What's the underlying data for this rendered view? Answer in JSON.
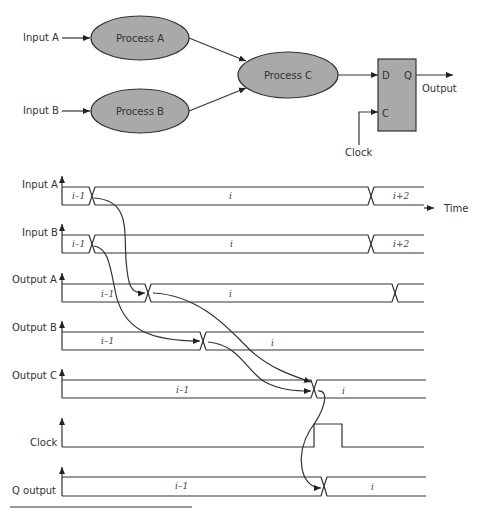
{
  "block_diagram": {
    "inputs": [
      {
        "label": "Input A"
      },
      {
        "label": "Input B"
      }
    ],
    "processes": [
      {
        "label": "Process A"
      },
      {
        "label": "Process B"
      },
      {
        "label": "Process C"
      }
    ],
    "flipflop": {
      "d_label": "D",
      "q_label": "Q",
      "c_label": "C"
    },
    "output_label": "Output",
    "clock_label": "Clock",
    "colors": {
      "process_fill": "#a9a9a9",
      "flipflop_fill": "#a9a9a9",
      "stroke": "#333333"
    }
  },
  "timing": {
    "time_label": "Time",
    "signals": [
      {
        "label": "Input A",
        "segments": [
          "i–1",
          "i",
          "i+2"
        ]
      },
      {
        "label": "Input B",
        "segments": [
          "i–1",
          "i",
          "i+2"
        ]
      },
      {
        "label": "Output A",
        "segments": [
          "i–1",
          "i"
        ]
      },
      {
        "label": "Output B",
        "segments": [
          "i–1",
          "i"
        ]
      },
      {
        "label": "Output C",
        "segments": [
          "i–1",
          "i"
        ]
      },
      {
        "label": "Clock",
        "segments": []
      },
      {
        "label": "Q output",
        "segments": [
          "i–1",
          "i"
        ]
      }
    ]
  }
}
